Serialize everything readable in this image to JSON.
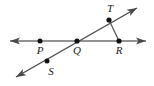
{
  "figure": {
    "type": "geometry-diagram",
    "background_color": "#ffffff",
    "line_color": "#6f6f6f",
    "point_color": "#111111",
    "label_color": "#1a1a1a",
    "canvas": {
      "width": 154,
      "height": 86
    },
    "points": [
      {
        "id": "P",
        "label": "P",
        "x": 40,
        "y": 41,
        "label_x": 40,
        "label_y": 54
      },
      {
        "id": "Q",
        "label": "Q",
        "x": 77,
        "y": 41,
        "label_x": 77,
        "label_y": 54
      },
      {
        "id": "R",
        "label": "R",
        "x": 119,
        "y": 41,
        "label_x": 119,
        "label_y": 54
      },
      {
        "id": "S",
        "label": "S",
        "x": 47,
        "y": 61,
        "label_x": 51,
        "label_y": 75
      },
      {
        "id": "T",
        "label": "T",
        "x": 109,
        "y": 20,
        "label_x": 110,
        "label_y": 12
      }
    ],
    "lines": [
      {
        "id": "horizontal-line",
        "name": "line-PR",
        "x1": 10,
        "y1": 41,
        "x2": 146,
        "y2": 41,
        "arrows": "both",
        "through": [
          "P",
          "Q",
          "R"
        ]
      },
      {
        "id": "diagonal-line",
        "name": "line-ST",
        "x1": 16,
        "y1": 77,
        "x2": 137,
        "y2": 8,
        "arrows": "both",
        "through": [
          "S",
          "Q",
          "T"
        ]
      }
    ],
    "segments": [
      {
        "id": "segment-TR",
        "name": "segment-TR",
        "x1": 109,
        "y1": 20,
        "x2": 119,
        "y2": 41,
        "arrows": "none",
        "endpoints": [
          "T",
          "R"
        ]
      }
    ]
  }
}
